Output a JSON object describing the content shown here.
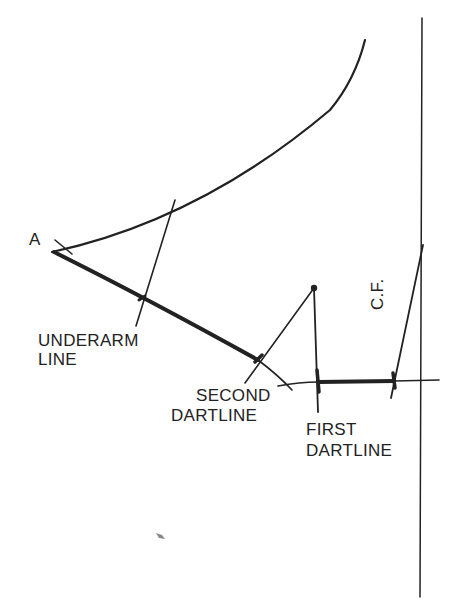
{
  "diagram": {
    "labels": {
      "point_a": "A",
      "underarm_line_1": "UNDERARM",
      "underarm_line_2": "LINE",
      "second_dartline_1": "SECOND",
      "second_dartline_2": "DARTLINE",
      "first_dartline_1": "FIRST",
      "first_dartline_2": "DARTLINE",
      "center_front": "C.F."
    },
    "colors": {
      "ink": "#222222",
      "background": "#ffffff"
    }
  }
}
